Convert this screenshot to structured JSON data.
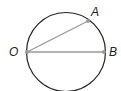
{
  "diagram": {
    "type": "circle-geometry",
    "circle": {
      "cx": 66,
      "cy": 52,
      "r": 39.5,
      "stroke": "#222222"
    },
    "points": [
      {
        "id": "O",
        "label": "O",
        "x": 27,
        "y": 52,
        "label_x": 9,
        "label_y": 56
      },
      {
        "id": "A",
        "label": "A",
        "x": 88,
        "y": 21,
        "label_x": 91,
        "label_y": 16
      },
      {
        "id": "B",
        "label": "B",
        "x": 104,
        "y": 52,
        "label_x": 109,
        "label_y": 56
      }
    ],
    "segments": [
      {
        "from": "O",
        "to": "A",
        "color": "#999999"
      },
      {
        "from": "O",
        "to": "B",
        "color": "#999999"
      }
    ],
    "point_color": "#999999"
  }
}
